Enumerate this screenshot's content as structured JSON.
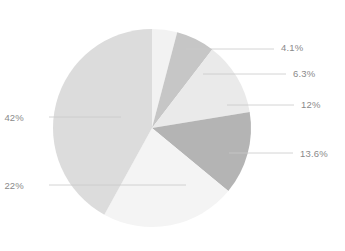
{
  "chart_data": {
    "type": "pie",
    "title": "",
    "subtitle": "",
    "xlabel": "",
    "ylabel": "",
    "legend_position": "none",
    "grid": false,
    "label_format": "percent",
    "start_angle_deg": 0,
    "direction": "clockwise",
    "categories": [
      "4.1%",
      "6.3%",
      "12%",
      "13.6%",
      "22%",
      "42%"
    ],
    "values": [
      4.1,
      6.3,
      12,
      13.6,
      22,
      42
    ],
    "slices": [
      {
        "label": "4.1%",
        "value": 4.1,
        "color": "#f2f2f2",
        "start_angle_deg": 0,
        "end_angle_deg": 14.76,
        "leader_side": "right",
        "label_x": 281,
        "label_y": 43,
        "line_x1": 186,
        "line_y1": 49,
        "line_x2": 274,
        "line_y2": 49
      },
      {
        "label": "6.3%",
        "value": 6.3,
        "color": "#c6c6c6",
        "start_angle_deg": 14.76,
        "end_angle_deg": 37.44,
        "leader_side": "right",
        "label_x": 293,
        "label_y": 69,
        "line_x1": 203,
        "line_y1": 74,
        "line_x2": 286,
        "line_y2": 74
      },
      {
        "label": "12%",
        "value": 12,
        "color": "#eaeaea",
        "start_angle_deg": 37.44,
        "end_angle_deg": 80.64,
        "leader_side": "right",
        "label_x": 301,
        "label_y": 100,
        "line_x1": 227,
        "line_y1": 105,
        "line_x2": 294,
        "line_y2": 105
      },
      {
        "label": "13.6%",
        "value": 13.6,
        "color": "#b4b4b4",
        "start_angle_deg": 80.64,
        "end_angle_deg": 129.6,
        "leader_side": "right",
        "label_x": 300,
        "label_y": 149,
        "line_x1": 229,
        "line_y1": 153,
        "line_x2": 293,
        "line_y2": 153
      },
      {
        "label": "22%",
        "value": 22,
        "color": "#f4f4f4",
        "start_angle_deg": 129.6,
        "end_angle_deg": 208.8,
        "leader_side": "left",
        "label_x": 24,
        "label_y": 181,
        "line_x1": 49,
        "line_y1": 185,
        "line_x2": 186,
        "line_y2": 185
      },
      {
        "label": "42%",
        "value": 42,
        "color": "#dcdcdc",
        "start_angle_deg": 208.8,
        "end_angle_deg": 360,
        "leader_side": "left",
        "label_x": 24,
        "label_y": 113,
        "line_x1": 49,
        "line_y1": 117,
        "line_x2": 121,
        "line_y2": 117
      }
    ],
    "geometry": {
      "center_x": 152,
      "center_y": 128,
      "radius": 99
    },
    "style": {
      "background": "#ffffff",
      "label_color": "#8a8a8a",
      "leader_line_color": "#c9c9c9"
    }
  }
}
